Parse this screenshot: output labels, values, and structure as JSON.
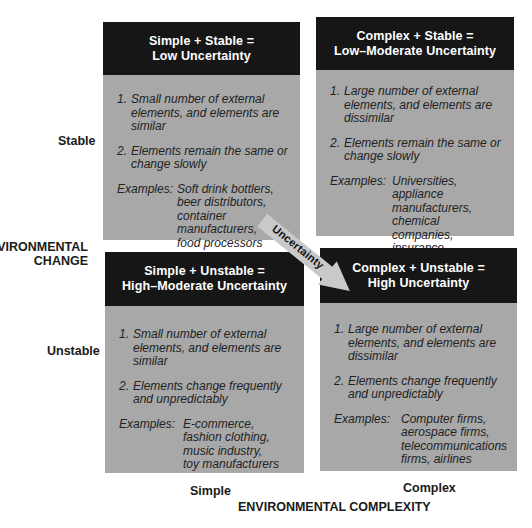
{
  "axes": {
    "y_title_line1": "ENVIRONMENTAL",
    "y_title_line2": "CHANGE",
    "y_top": "Stable",
    "y_bottom": "Unstable",
    "x_left": "Simple",
    "x_right": "Complex",
    "x_title": "ENVIRONMENTAL COMPLEXITY"
  },
  "arrow": {
    "label": "Uncertainty"
  },
  "colors": {
    "header_bg": "#161616",
    "header_text": "#ffffff",
    "body_bg": "#a8a8a8",
    "arrow_fill": "#c9c9c9"
  },
  "quadrants": {
    "simple_stable": {
      "title_line1": "Simple + Stable =",
      "title_line2": "Low Uncertainty",
      "items": [
        {
          "num": "1.",
          "text": "Small number of external elements, and elements are similar"
        },
        {
          "num": "2.",
          "text": "Elements remain the same or change slowly"
        }
      ],
      "examples_label": "Examples:",
      "examples": [
        "Soft drink bottlers,",
        "beer distributors,",
        "container manufacturers,",
        "food processors"
      ]
    },
    "complex_stable": {
      "title_line1": "Complex + Stable =",
      "title_line2": "Low–Moderate Uncertainty",
      "items": [
        {
          "num": "1.",
          "text": "Large number of external elements, and elements are dissimilar"
        },
        {
          "num": "2.",
          "text": "Elements remain the same or change slowly"
        }
      ],
      "examples_label": "Examples:",
      "examples": [
        "Universities,",
        "appliance manufacturers,",
        "chemical companies,",
        "insurance companies"
      ]
    },
    "simple_unstable": {
      "title_line1": "Simple + Unstable =",
      "title_line2": "High–Moderate Uncertainty",
      "items": [
        {
          "num": "1.",
          "text": "Small number of external elements, and elements are similar"
        },
        {
          "num": "2.",
          "text": "Elements change frequently and unpredictably"
        }
      ],
      "examples_label": "Examples:",
      "examples": [
        "E-commerce,",
        "fashion clothing,",
        "music industry,",
        "toy manufacturers"
      ]
    },
    "complex_unstable": {
      "title_line1": "Complex + Unstable =",
      "title_line2": "High Uncertainty",
      "items": [
        {
          "num": "1.",
          "text": "Large number of external elements, and elements are dissimilar"
        },
        {
          "num": "2.",
          "text": "Elements change frequently and unpredictably"
        }
      ],
      "examples_label": "Examples:",
      "examples": [
        "Computer firms,",
        "aerospace firms,",
        "telecommunications",
        "firms, airlines"
      ]
    }
  }
}
